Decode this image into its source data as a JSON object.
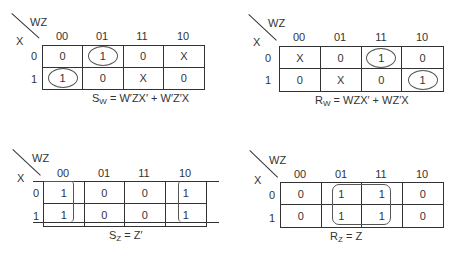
{
  "kmaps": [
    {
      "id": "sw",
      "var_top": "WZ",
      "var_left": "X",
      "columns": [
        "00",
        "01",
        "11",
        "10"
      ],
      "rows": [
        "0",
        "1"
      ],
      "cells": [
        [
          "0",
          "1",
          "0",
          "X"
        ],
        [
          "1",
          "0",
          "X",
          "0"
        ]
      ],
      "groups": "ovals around (X=0,WZ=01) and (X=1,WZ=00)",
      "eq_lhs": "S",
      "eq_sub": "W",
      "eq_rhs": " = W′ZX′ + W′Z′X"
    },
    {
      "id": "rw",
      "var_top": "WZ",
      "var_left": "X",
      "columns": [
        "00",
        "01",
        "11",
        "10"
      ],
      "rows": [
        "0",
        "1"
      ],
      "cells": [
        [
          "X",
          "0",
          "1",
          "0"
        ],
        [
          "0",
          "X",
          "0",
          "1"
        ]
      ],
      "groups": "ovals around (X=0,WZ=11) and (X=1,WZ=10)",
      "eq_lhs": "R",
      "eq_sub": "W",
      "eq_rhs": " = WZX′ + WZ′X"
    },
    {
      "id": "sz",
      "var_top": "WZ",
      "var_left": "X",
      "columns": [
        "00",
        "01",
        "11",
        "10"
      ],
      "rows": [
        "0",
        "1"
      ],
      "cells": [
        [
          "1",
          "0",
          "0",
          "1"
        ],
        [
          "1",
          "0",
          "0",
          "1"
        ]
      ],
      "groups": "wrap-around group of columns 00 and 10",
      "eq_lhs": "S",
      "eq_sub": "Z",
      "eq_rhs": " = Z′"
    },
    {
      "id": "rz",
      "var_top": "WZ",
      "var_left": "X",
      "columns": [
        "00",
        "01",
        "11",
        "10"
      ],
      "rows": [
        "0",
        "1"
      ],
      "cells": [
        [
          "0",
          "1",
          "1",
          "0"
        ],
        [
          "0",
          "1",
          "1",
          "0"
        ]
      ],
      "groups": "rounded rectangle around columns 01 and 11",
      "eq_lhs": "R",
      "eq_sub": "Z",
      "eq_rhs": " = Z"
    }
  ]
}
